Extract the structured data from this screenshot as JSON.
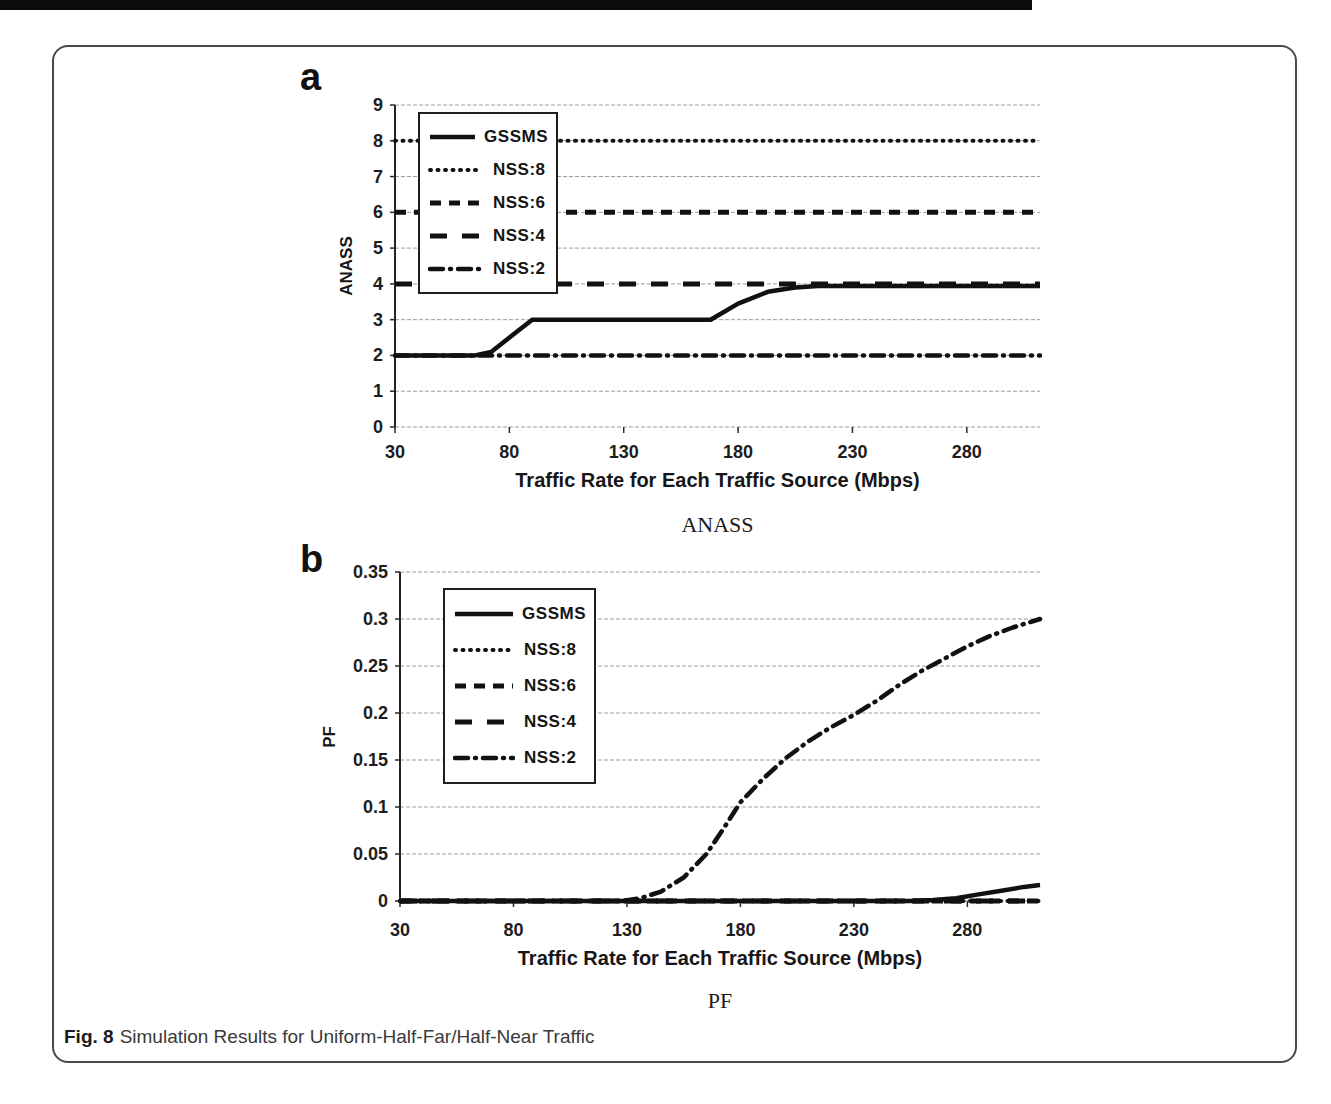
{
  "figure": {
    "caption": {
      "label": "Fig. 8",
      "text": "Simulation Results for Uniform-Half-Far/Half-Near Traffic"
    }
  },
  "chart_data": [
    {
      "id": "a",
      "panel_label": "a",
      "type": "line",
      "sub_caption": "ANASS",
      "xlabel": "Traffic Rate for Each Traffic Source (Mbps)",
      "ylabel": "ANASS",
      "xlim": [
        30,
        312
      ],
      "ylim": [
        0,
        9
      ],
      "x_ticks": [
        30,
        80,
        130,
        180,
        230,
        280
      ],
      "y_ticks": [
        9,
        8,
        7,
        6,
        5,
        4,
        3,
        2,
        1,
        0
      ],
      "grid": true,
      "legend_position": "upper-left",
      "line_color": "#111111",
      "series": [
        {
          "name": "GSSMS",
          "style": "solid",
          "points": [
            [
              30,
              2
            ],
            [
              65,
              2
            ],
            [
              72,
              2.1
            ],
            [
              90,
              3
            ],
            [
              168,
              3
            ],
            [
              180,
              3.45
            ],
            [
              193,
              3.78
            ],
            [
              205,
              3.9
            ],
            [
              215,
              3.94
            ],
            [
              312,
              3.94
            ]
          ]
        },
        {
          "name": "NSS:8",
          "style": "dotted",
          "points": [
            [
              30,
              8
            ],
            [
              312,
              8
            ]
          ]
        },
        {
          "name": "NSS:6",
          "style": "dashed",
          "points": [
            [
              30,
              6
            ],
            [
              312,
              6
            ]
          ]
        },
        {
          "name": "NSS:4",
          "style": "longdash",
          "points": [
            [
              30,
              4
            ],
            [
              312,
              4
            ]
          ]
        },
        {
          "name": "NSS:2",
          "style": "dashdot",
          "points": [
            [
              30,
              2
            ],
            [
              312,
              2
            ]
          ]
        }
      ]
    },
    {
      "id": "b",
      "panel_label": "b",
      "type": "line",
      "sub_caption": "PF",
      "xlabel": "Traffic Rate for Each Traffic Source (Mbps)",
      "ylabel": "PF",
      "xlim": [
        30,
        312
      ],
      "ylim": [
        0,
        0.35
      ],
      "x_ticks": [
        30,
        80,
        130,
        180,
        230,
        280
      ],
      "y_ticks": [
        0.35,
        0.3,
        0.25,
        0.2,
        0.15,
        0.1,
        0.05,
        0
      ],
      "grid": true,
      "legend_position": "upper-left",
      "line_color": "#111111",
      "series": [
        {
          "name": "GSSMS",
          "style": "solid",
          "points": [
            [
              30,
              0
            ],
            [
              255,
              0
            ],
            [
              265,
              0.001
            ],
            [
              275,
              0.003
            ],
            [
              285,
              0.007
            ],
            [
              295,
              0.011
            ],
            [
              305,
              0.015
            ],
            [
              312,
              0.017
            ]
          ]
        },
        {
          "name": "NSS:8",
          "style": "dotted",
          "points": [
            [
              30,
              0
            ],
            [
              312,
              0
            ]
          ]
        },
        {
          "name": "NSS:6",
          "style": "dashed",
          "points": [
            [
              30,
              0
            ],
            [
              312,
              0
            ]
          ]
        },
        {
          "name": "NSS:4",
          "style": "longdash",
          "points": [
            [
              30,
              0
            ],
            [
              312,
              0
            ]
          ]
        },
        {
          "name": "NSS:2",
          "style": "dashdot",
          "points": [
            [
              30,
              0
            ],
            [
              128,
              0
            ],
            [
              136,
              0.003
            ],
            [
              145,
              0.01
            ],
            [
              155,
              0.025
            ],
            [
              165,
              0.05
            ],
            [
              172,
              0.075
            ],
            [
              180,
              0.105
            ],
            [
              190,
              0.13
            ],
            [
              200,
              0.152
            ],
            [
              210,
              0.17
            ],
            [
              220,
              0.185
            ],
            [
              230,
              0.198
            ],
            [
              240,
              0.213
            ],
            [
              250,
              0.23
            ],
            [
              260,
              0.245
            ],
            [
              270,
              0.258
            ],
            [
              280,
              0.271
            ],
            [
              290,
              0.282
            ],
            [
              300,
              0.291
            ],
            [
              312,
              0.3
            ]
          ]
        }
      ]
    }
  ]
}
